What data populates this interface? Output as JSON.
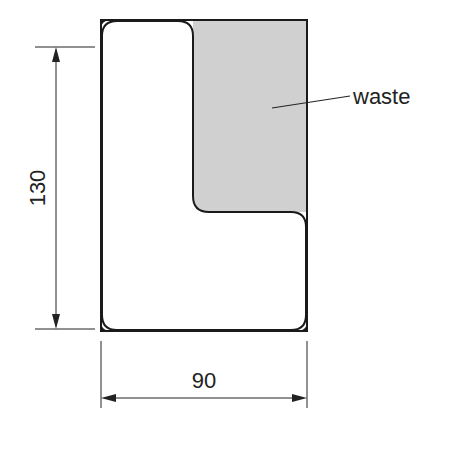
{
  "diagram": {
    "type": "technical-drawing",
    "colors": {
      "outline": "#1a1a1a",
      "waste_fill": "#d0d0d0",
      "background": "#ffffff"
    },
    "shape": {
      "outer": "rectangle",
      "part": "L-shaped piece with rounded corners",
      "waste_region": "upper-right shaded area"
    },
    "labels": {
      "waste": "waste",
      "height_dim": "130",
      "width_dim": "90"
    }
  }
}
